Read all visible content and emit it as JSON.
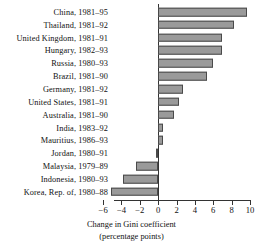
{
  "chart_data": {
    "type": "bar",
    "orientation": "horizontal",
    "title": "",
    "xlabel": "Change in Gini coefficient (percentage points)",
    "xlabel_line1": "Change in Gini coefficient",
    "xlabel_line2": "(percentage points)",
    "ylabel": "",
    "xlim": [
      -6,
      10
    ],
    "xticks": [
      -6,
      -4,
      -2,
      0,
      2,
      4,
      6,
      8,
      10
    ],
    "xticklabels": [
      "−6",
      "−4",
      "−2",
      "0",
      "2",
      "4",
      "6",
      "8",
      "10"
    ],
    "grid": false,
    "legend": false,
    "bar_fill_color": "#9a9a9a",
    "bar_edge_color": "#4a4a4a",
    "axis_color": "#333333",
    "categories": [
      "China, 1981–95",
      "Thailand, 1981–92",
      "United Kingdom, 1981–91",
      "Hungary, 1982–93",
      "Russia, 1980–93",
      "Brazil, 1981–90",
      "Germany, 1981–92",
      "United States, 1981–91",
      "Australia, 1981–90",
      "India, 1983–92",
      "Mauritius, 1986–93",
      "Jordan, 1980–91",
      "Malaysia, 1979–89",
      "Indonesia, 1980–93",
      "Korea, Rep. of, 1980–88"
    ],
    "values": [
      9.7,
      8.3,
      7.0,
      6.9,
      6.0,
      5.3,
      2.7,
      2.3,
      1.7,
      0.5,
      0.5,
      -0.2,
      -2.4,
      -3.8,
      -5.1
    ]
  }
}
